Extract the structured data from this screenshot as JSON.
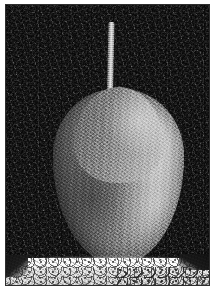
{
  "image": {
    "title": "Noisy grayscale photograph of a pear",
    "subject": "pear",
    "color_mode": "grayscale",
    "width_px": 215,
    "height_px": 290,
    "noise": "heavy salt-and-pepper / gaussian grain"
  },
  "frame": {
    "mat_color": "#ffffff",
    "border_color": "#2e2e2e",
    "border_width_px": 1,
    "mat_padding_px": 4
  },
  "scene": {
    "background": {
      "name": "dark speckled backdrop",
      "base_color": "#111111",
      "description": "near-black背 background saturated with bright and dark speckle noise"
    },
    "pear": {
      "name": "pear",
      "body_color_light": "#c9c9c9",
      "body_color_mid": "#8a8a8a",
      "body_color_shadow": "#5d5d5d",
      "highlight_side": "right",
      "shadow_side": "left",
      "body_bounds": {
        "x": 47,
        "y": 84,
        "width": 131,
        "height": 176
      },
      "stem": {
        "name": "stem",
        "color": "#d2d2d2",
        "bounds": {
          "x": 101,
          "y": 17,
          "width": 6,
          "height": 70
        },
        "tilt_deg": 1.2
      }
    },
    "surface": {
      "name": "bright textured stone slab",
      "highlight_color": "#f3f3f3",
      "mid_color": "#d3d3d3",
      "speckle_color": "#282828",
      "top_y": 253,
      "description": "rough bright stone ledge with dark mineral speckles, denser on the right"
    },
    "contact_shadow": {
      "name": "contact shadow",
      "color": "#000000",
      "bounds": {
        "x": 52,
        "y": 246,
        "width": 118,
        "height": 20
      }
    }
  }
}
